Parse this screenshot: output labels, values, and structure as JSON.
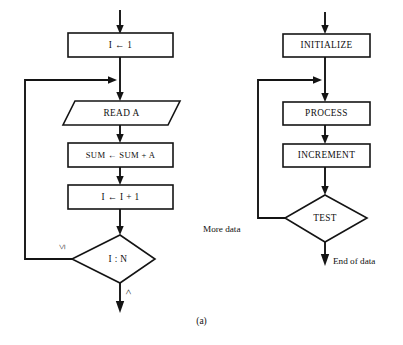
{
  "figure": {
    "caption": "(a)"
  },
  "left_chart": {
    "name": "summation-loop-flowchart",
    "nodes": [
      {
        "id": "init",
        "label": "I ← 1",
        "shape": "process"
      },
      {
        "id": "read",
        "label": "READ A",
        "shape": "input-output"
      },
      {
        "id": "accumulate",
        "label": "SUM ← SUM + A",
        "shape": "process"
      },
      {
        "id": "increment",
        "label": "I ← I + 1",
        "shape": "process"
      },
      {
        "id": "test",
        "label": "I : N",
        "shape": "decision"
      }
    ],
    "branch_labels": {
      "loop_back": "≤",
      "exit": ">"
    }
  },
  "right_chart": {
    "name": "generic-loop-flowchart",
    "nodes": [
      {
        "id": "initialize",
        "label": "INITIALIZE",
        "shape": "process"
      },
      {
        "id": "process",
        "label": "PROCESS",
        "shape": "process"
      },
      {
        "id": "increment",
        "label": "INCREMENT",
        "shape": "process"
      },
      {
        "id": "test",
        "label": "TEST",
        "shape": "decision"
      }
    ],
    "branch_labels": {
      "loop_back": "More data",
      "exit": "End of data"
    }
  },
  "colors": {
    "ink": "#141414",
    "paper": "#ffffff"
  }
}
